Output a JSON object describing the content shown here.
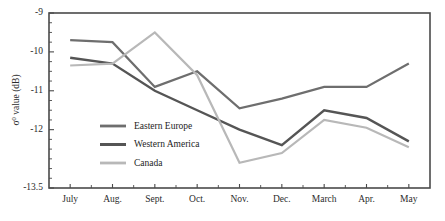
{
  "chart_data": {
    "type": "line",
    "title": "",
    "xlabel": "",
    "ylabel": "σ⁰ value (dB)",
    "ylabel_base": "σ",
    "ylabel_sup": "0",
    "ylabel_rest": " value (dB)",
    "categories": [
      "July",
      "Aug.",
      "Sept.",
      "Oct.",
      "Nov.",
      "Dec.",
      "March",
      "Apr.",
      "May"
    ],
    "x": [
      0,
      1,
      2,
      3,
      4,
      5,
      6,
      7,
      8
    ],
    "ylim": [
      -13.5,
      -9.0
    ],
    "ytick_labels": [
      "-9",
      "-10",
      "-11",
      "-12",
      "-13.5"
    ],
    "ytick_values": [
      -9.0,
      -10.0,
      -11.0,
      -12.0,
      -13.5
    ],
    "grid": false,
    "legend_position": "inside-lower-left",
    "series": [
      {
        "name": "Eastern Europe",
        "color": "#6e6e6e",
        "width": 2.2,
        "values": [
          -9.7,
          -9.75,
          -10.9,
          -10.5,
          -11.45,
          -11.2,
          -10.9,
          -10.9,
          -10.3
        ]
      },
      {
        "name": "Western America",
        "color": "#555555",
        "width": 2.4,
        "values": [
          -10.15,
          -10.3,
          -11.0,
          -11.5,
          -12.0,
          -12.4,
          -11.5,
          -11.7,
          -12.3
        ]
      },
      {
        "name": "Canada",
        "color": "#b8b8b8",
        "width": 2.2,
        "values": [
          -10.35,
          -10.3,
          -9.5,
          -10.6,
          -12.85,
          -12.6,
          -11.75,
          -11.95,
          -12.45
        ]
      }
    ]
  },
  "legend": {
    "entries": [
      {
        "label": "Eastern Europe"
      },
      {
        "label": "Western America"
      },
      {
        "label": "Canada"
      }
    ]
  }
}
